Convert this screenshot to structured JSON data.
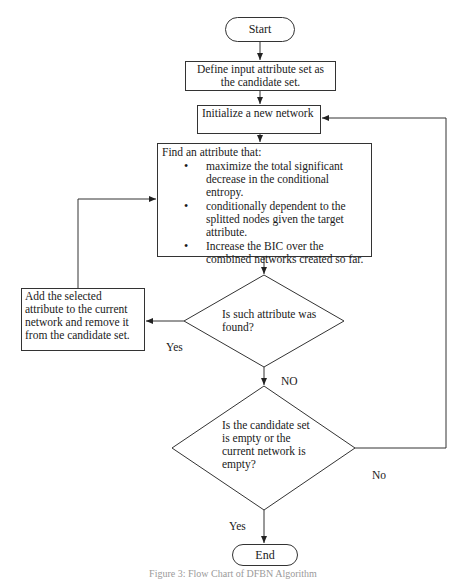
{
  "flowchart": {
    "start": "Start",
    "end": "End",
    "define_step": "Define input attribute set as the candidate set.",
    "init_step": "Initialize a new network",
    "find_step": {
      "title": "Find an attribute that:",
      "criteria": [
        "maximize the total significant decrease in the conditional entropy.",
        "conditionally dependent to the splitted nodes given the target attribute.",
        "Increase the BIC over the combined networks created so far."
      ]
    },
    "decision_found": "Is such attribute was found?",
    "add_step": "Add the selected attribute to the current network and remove it from the candidate set.",
    "decision_empty": "Is the candidate set is empty or the current network is empty?",
    "labels": {
      "found_yes": "Yes",
      "found_no": "NO",
      "empty_no": "No",
      "empty_yes": "Yes"
    }
  },
  "caption": "Figure 3: Flow Chart of DFBN Algorithm",
  "colors": {
    "stroke": "#333333",
    "text": "#1a1a1a",
    "caption": "#9a9a9a"
  }
}
